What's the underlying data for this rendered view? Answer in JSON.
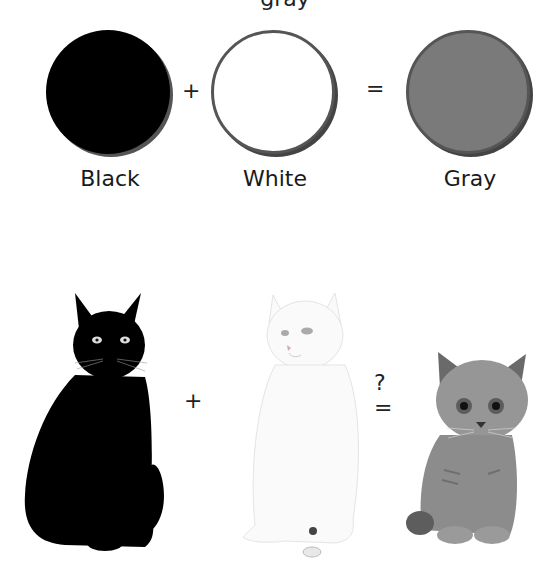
{
  "header": {
    "cut_off_title": "gray"
  },
  "equation_colors": {
    "items": [
      {
        "name": "Black",
        "color": "#000000"
      },
      {
        "name": "White",
        "color": "#ffffff"
      },
      {
        "name": "Gray",
        "color": "#7a7a7a"
      }
    ],
    "plus": "+",
    "equals": "="
  },
  "equation_cats": {
    "items": [
      {
        "name": "black-cat",
        "color": "#000000"
      },
      {
        "name": "white-cat",
        "color": "#f7f7f7"
      },
      {
        "name": "gray-kitten",
        "color": "#8a8a8a"
      }
    ],
    "plus": "+",
    "question": "?",
    "equals": "="
  }
}
